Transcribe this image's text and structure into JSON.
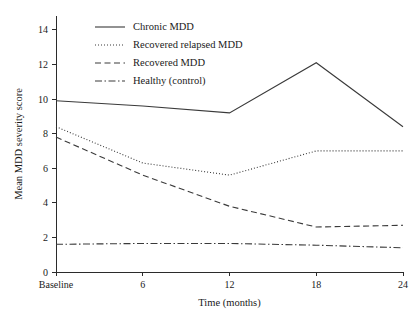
{
  "chart_data": {
    "type": "line",
    "title": "",
    "xlabel": "Time (months)",
    "ylabel": "Mean MDD severity score",
    "x": [
      0,
      6,
      12,
      18,
      24
    ],
    "categories": [
      "Baseline",
      "6",
      "12",
      "18",
      "24"
    ],
    "xtick_labels": [
      "Baseline",
      "6",
      "12",
      "18",
      "24"
    ],
    "ytick_labels": [
      "0",
      "2",
      "4",
      "6",
      "8",
      "10",
      "12",
      "14"
    ],
    "ytick_values": [
      0,
      2,
      4,
      6,
      8,
      10,
      12,
      14
    ],
    "ylim": [
      0,
      14.8
    ],
    "xlim": [
      0,
      24
    ],
    "grid": false,
    "legend_position": "top-left",
    "series": [
      {
        "name": "Chronic MDD",
        "style": "solid",
        "values": [
          9.9,
          9.6,
          9.2,
          12.1,
          8.4
        ]
      },
      {
        "name": "Recovered relapsed MDD",
        "style": "dotted",
        "values": [
          8.4,
          6.3,
          5.6,
          7.0,
          7.0
        ]
      },
      {
        "name": "Recovered MDD",
        "style": "dashed",
        "values": [
          7.8,
          5.6,
          3.8,
          2.6,
          2.7
        ]
      },
      {
        "name": "Healthy (control)",
        "style": "dash-dot",
        "values": [
          1.6,
          1.65,
          1.65,
          1.55,
          1.4
        ]
      }
    ]
  }
}
